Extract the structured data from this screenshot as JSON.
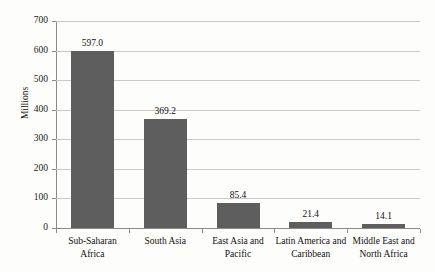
{
  "chart_data": {
    "type": "bar",
    "title": "",
    "xlabel": "",
    "ylabel": "Millions",
    "ylim": [
      0,
      700
    ],
    "yticks": [
      0,
      100,
      200,
      300,
      400,
      500,
      600,
      700
    ],
    "ytick_labels": [
      "0",
      "100",
      "200",
      "300",
      "400",
      "500",
      "600",
      "700"
    ],
    "grid": true,
    "legend": "none",
    "bar_color": "#5e5e5e",
    "gridline_color": "#c9c9c9",
    "axis_color": "#8a8a8a",
    "categories": [
      "Sub-Saharan Africa",
      "South Asia",
      "East Asia and Pacific",
      "Latin America and Caribbean",
      "Middle East and North Africa"
    ],
    "category_lines": [
      [
        "Sub-Saharan",
        "Africa"
      ],
      [
        "South Asia"
      ],
      [
        "East Asia and",
        "Pacific"
      ],
      [
        "Latin America and",
        "Caribbean"
      ],
      [
        "Middle East and",
        "North Africa"
      ]
    ],
    "values": [
      597.0,
      369.2,
      85.4,
      21.4,
      14.1
    ],
    "value_labels": [
      "597.0",
      "369.2",
      "85.4",
      "21.4",
      "14.1"
    ]
  }
}
